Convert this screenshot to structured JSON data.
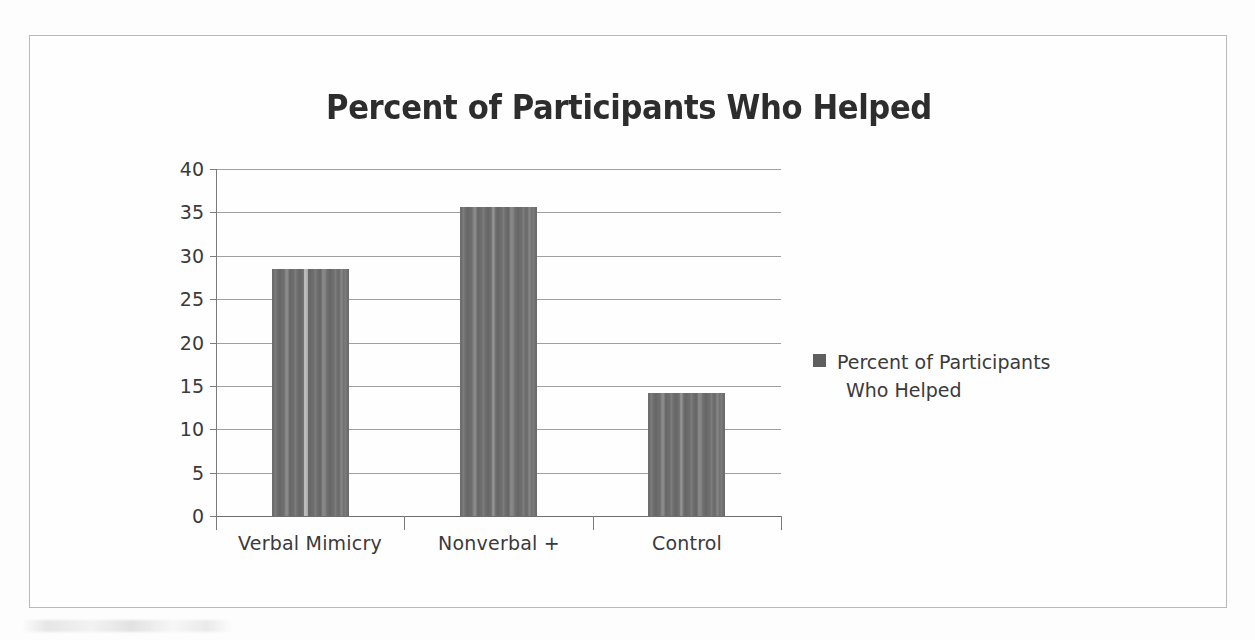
{
  "chart_data": {
    "type": "bar",
    "title": "Percent of Participants Who Helped",
    "xlabel": "",
    "ylabel": "",
    "categories": [
      "Verbal Mimicry",
      "Nonverbal +",
      "Control"
    ],
    "values": [
      28.5,
      35.6,
      14.2
    ],
    "series": [
      {
        "name": "Percent of Participants Who Helped",
        "values": [
          28.5,
          35.6,
          14.2
        ]
      }
    ],
    "ylim": [
      0,
      40
    ],
    "ytick_step": 5,
    "ytick_labels": [
      "40",
      "35",
      "30",
      "25",
      "20",
      "15",
      "10",
      "5",
      "0"
    ],
    "ytick_values": [
      40,
      35,
      30,
      25,
      20,
      15,
      10,
      5,
      0
    ],
    "grid": true,
    "grid_axis": "y",
    "legend_position": "right",
    "legend_entries": [
      {
        "label_line_1": "Percent of Participants",
        "label_line_2": "Who Helped",
        "color": "#5f5f5f"
      }
    ],
    "bar_color": "#6d6d6d",
    "background_color": "#fdfdfd",
    "frame_color": "#b9b9b9",
    "text_color": "#3a3a3a",
    "title_color": "#2d2d2d"
  }
}
